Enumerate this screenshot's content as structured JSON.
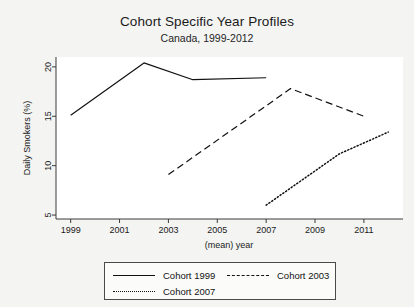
{
  "chart_data": {
    "type": "line",
    "title": "Cohort Specific Year Profiles",
    "subtitle": "Canada, 1999-2012",
    "xlabel": "(mean) year",
    "ylabel": "Daily Smokers (%)",
    "xlim": [
      1998.4,
      2012.6
    ],
    "ylim": [
      4.6,
      21.0
    ],
    "xticks": [
      1999,
      2001,
      2003,
      2005,
      2007,
      2009,
      2011
    ],
    "yticks": [
      5,
      10,
      15,
      20
    ],
    "grid": false,
    "legend_position": "bottom",
    "series": [
      {
        "name": "Cohort 1999",
        "style": "solid",
        "color": "#111111",
        "x": [
          1999,
          2002,
          2004,
          2007
        ],
        "values": [
          15.1,
          20.4,
          18.7,
          18.9
        ]
      },
      {
        "name": "Cohort 2003",
        "style": "dashed",
        "color": "#111111",
        "x": [
          2003,
          2008,
          2011
        ],
        "values": [
          9.1,
          17.8,
          15.0
        ]
      },
      {
        "name": "Cohort 2007",
        "style": "dotted",
        "color": "#111111",
        "x": [
          2007,
          2010,
          2012
        ],
        "values": [
          6.0,
          11.2,
          13.4
        ]
      }
    ]
  },
  "legend": {
    "items": [
      {
        "label": "Cohort 1999",
        "style": "solid"
      },
      {
        "label": "Cohort 2003",
        "style": "dashed"
      },
      {
        "label": "Cohort 2007",
        "style": "dotted"
      }
    ]
  }
}
